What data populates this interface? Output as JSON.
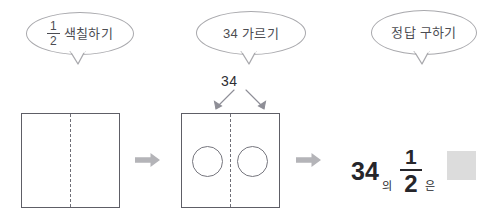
{
  "worksheet": {
    "steps": [
      {
        "id": "color-half",
        "bubble_prefix_numerator": "1",
        "bubble_prefix_denominator": "2",
        "bubble_label": "색칠하기",
        "shape": {
          "name": "half-divided-rectangle",
          "divider": "dashed-vertical",
          "circles": 0
        }
      },
      {
        "id": "split-34",
        "bubble_label": "34 가르기",
        "split_value": "34",
        "shape": {
          "name": "half-divided-rectangle-with-circles",
          "divider": "dashed-vertical",
          "circles": 2
        }
      },
      {
        "id": "find-answer",
        "bubble_label": "정답 구하기",
        "equation": {
          "whole": "34",
          "particle_of": "의",
          "fraction_numerator": "1",
          "fraction_denominator": "2",
          "particle_topic": "은",
          "answer_value": ""
        }
      }
    ],
    "flow_arrows": [
      {
        "name": "flow-arrow-1",
        "glyph": "right-arrow"
      },
      {
        "name": "flow-arrow-2",
        "glyph": "right-arrow"
      }
    ],
    "colors": {
      "bubble_stroke": "#a9a9ad",
      "bubble_text": "#4c4c52",
      "square_stroke": "#5e5e66",
      "divider_stroke": "#6e6e76",
      "circle_stroke": "#76767e",
      "flow_arrow": "#b4b4b8",
      "split_arrow": "#8e8e96",
      "equation_text": "#26262b",
      "answer_box_fill": "#dcdcdc",
      "background": "#ffffff"
    }
  }
}
